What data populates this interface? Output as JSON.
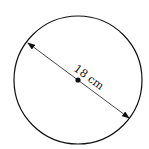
{
  "diagram": {
    "shape": "circle",
    "label": "18 cm",
    "measurement": "diameter",
    "colors": {
      "stroke": "#111111",
      "background": "#ffffff"
    }
  }
}
